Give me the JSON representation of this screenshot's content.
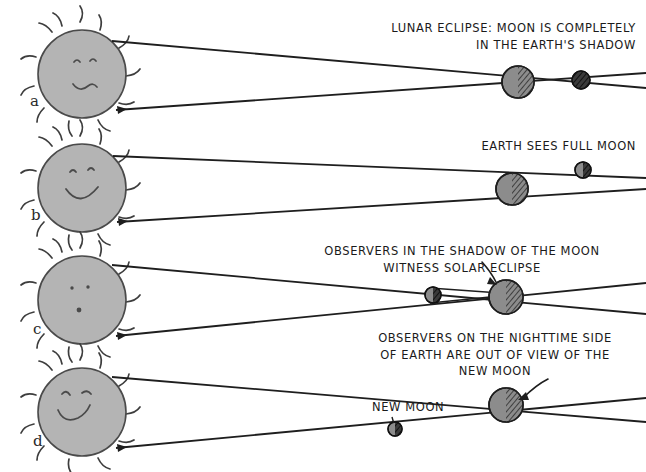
{
  "figure": {
    "background_color": "#ffffff",
    "ink_color": "#1a1a1a",
    "sun_fill": "#b3b3b3",
    "body_fill": "#8c8c8c",
    "shadow_fill": "#333333",
    "width": 646,
    "height": 472
  },
  "panels": [
    {
      "letter": "a",
      "caption": "LUNAR ECLIPSE: MOON IS COMPLETELY\nIN THE EARTH'S SHADOW",
      "sun": {
        "name": "sun",
        "face": "neutral-smile",
        "cx": 82,
        "cy": 74,
        "r": 44
      },
      "earth": {
        "name": "earth",
        "cx": 518,
        "cy": 82,
        "r": 16,
        "lit_side": "left"
      },
      "moon": {
        "name": "moon",
        "cx": 581,
        "cy": 80,
        "r": 9,
        "state": "eclipsed-dark"
      }
    },
    {
      "letter": "b",
      "caption": "EARTH SEES FULL MOON",
      "sun": {
        "name": "sun",
        "face": "big-smile",
        "cx": 82,
        "cy": 188,
        "r": 44
      },
      "earth": {
        "name": "earth",
        "cx": 512,
        "cy": 189,
        "r": 16,
        "lit_side": "left"
      },
      "moon": {
        "name": "moon",
        "cx": 583,
        "cy": 170,
        "r": 8,
        "state": "full"
      }
    },
    {
      "letter": "c",
      "caption": "OBSERVERS IN THE SHADOW OF THE MOON\nWITNESS SOLAR ECLIPSE",
      "sun": {
        "name": "sun",
        "face": "freckles",
        "cx": 82,
        "cy": 300,
        "r": 44
      },
      "earth": {
        "name": "earth",
        "cx": 506,
        "cy": 297,
        "r": 17,
        "lit_side": "left"
      },
      "moon": {
        "name": "moon",
        "cx": 433,
        "cy": 295,
        "r": 8,
        "state": "new"
      },
      "arrow": {
        "name": "solar-eclipse-arrow",
        "from": [
          487,
          266
        ],
        "to": [
          500,
          283
        ]
      }
    },
    {
      "letter": "d",
      "caption": "OBSERVERS ON THE NIGHTTIME SIDE\nOF EARTH ARE OUT OF VIEW OF THE\nNEW MOON",
      "extra_label": "NEW MOON",
      "sun": {
        "name": "sun",
        "face": "wink-smile",
        "cx": 82,
        "cy": 412,
        "r": 44
      },
      "earth": {
        "name": "earth",
        "cx": 506,
        "cy": 405,
        "r": 17,
        "lit_side": "left"
      },
      "moon": {
        "name": "moon",
        "cx": 395,
        "cy": 429,
        "r": 7,
        "state": "new"
      },
      "arrow": {
        "name": "new-moon-arrow",
        "from": [
          537,
          388
        ],
        "to": [
          517,
          402
        ]
      }
    }
  ],
  "legend_notes": {
    "light_cone": "tangent lines from sun limb converging past earth",
    "hatching": "diagonal hatching marks the night / shadow side"
  }
}
